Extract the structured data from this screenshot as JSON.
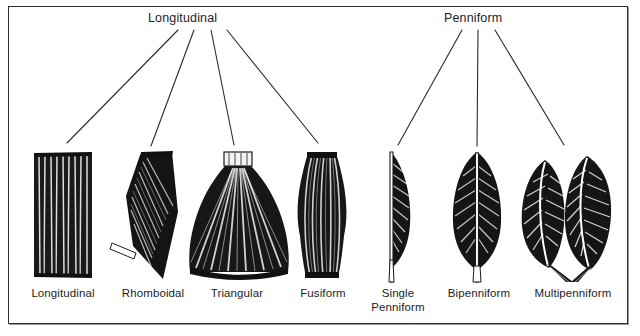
{
  "figure": {
    "title_group_left": "Longitudinal",
    "title_group_right": "Penniform",
    "ink_color": "#141414",
    "frame_color": "#2f2f2f",
    "background": "#ffffff"
  },
  "groups": [
    {
      "name": "Longitudinal",
      "label": "Longitudinal",
      "member_count": 4,
      "label_x": 200,
      "label_y": 18
    },
    {
      "name": "Penniform",
      "label": "Penniform",
      "member_count": 3,
      "label_x": 478,
      "label_y": 18
    }
  ],
  "muscles": [
    {
      "id": "longitudinal",
      "caption": "Longitudinal",
      "group": "Longitudinal",
      "shape": "parallel-strap",
      "center_x": 63,
      "top_y": 150,
      "bottom_y": 278
    },
    {
      "id": "rhomboidal",
      "caption": "Rhomboidal",
      "group": "Longitudinal",
      "shape": "rhomboid",
      "center_x": 152,
      "top_y": 152,
      "bottom_y": 280
    },
    {
      "id": "triangular",
      "caption": "Triangular",
      "group": "Longitudinal",
      "shape": "fan-triangle",
      "center_x": 237,
      "top_y": 151,
      "bottom_y": 280
    },
    {
      "id": "fusiform",
      "caption": "Fusiform",
      "group": "Longitudinal",
      "shape": "spindle",
      "center_x": 322,
      "top_y": 150,
      "bottom_y": 280
    },
    {
      "id": "single-penniform",
      "caption": "Single\nPenniform",
      "group": "Penniform",
      "shape": "half-feather",
      "center_x": 397,
      "top_y": 150,
      "bottom_y": 282
    },
    {
      "id": "bipenniform",
      "caption": "Bipenniform",
      "group": "Penniform",
      "shape": "full-feather",
      "center_x": 478,
      "top_y": 150,
      "bottom_y": 282
    },
    {
      "id": "multipenniform",
      "caption": "Multipenniform",
      "group": "Penniform",
      "shape": "double-feather",
      "center_x": 572,
      "top_y": 150,
      "bottom_y": 282
    }
  ],
  "leaders": [
    {
      "from_group": "Longitudinal",
      "to": "longitudinal",
      "x1": 178,
      "y1": 30,
      "x2": 67,
      "y2": 143
    },
    {
      "from_group": "Longitudinal",
      "to": "rhomboidal",
      "x1": 194,
      "y1": 30,
      "x2": 151,
      "y2": 146
    },
    {
      "from_group": "Longitudinal",
      "to": "triangular",
      "x1": 211,
      "y1": 30,
      "x2": 234,
      "y2": 145
    },
    {
      "from_group": "Longitudinal",
      "to": "fusiform",
      "x1": 227,
      "y1": 30,
      "x2": 318,
      "y2": 143
    },
    {
      "from_group": "Penniform",
      "to": "single-penniform",
      "x1": 462,
      "y1": 30,
      "x2": 398,
      "y2": 145
    },
    {
      "from_group": "Penniform",
      "to": "bipenniform",
      "x1": 478,
      "y1": 30,
      "x2": 477,
      "y2": 146
    },
    {
      "from_group": "Penniform",
      "to": "multipenniform",
      "x1": 495,
      "y1": 30,
      "x2": 564,
      "y2": 145
    }
  ]
}
